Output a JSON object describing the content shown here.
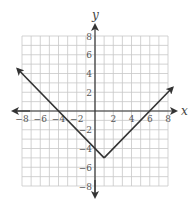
{
  "chart_data": {
    "type": "line",
    "title": "",
    "xlabel": "x",
    "ylabel": "y",
    "xlim": [
      -8,
      8
    ],
    "ylim": [
      -8,
      8
    ],
    "grid": true,
    "grid_step": 1,
    "x_ticks": [
      -8,
      -6,
      -4,
      -2,
      2,
      4,
      6,
      8
    ],
    "y_ticks": [
      8,
      6,
      4,
      2,
      -2,
      -4,
      -6,
      -8
    ],
    "series": [
      {
        "name": "y = |x - 1| - 5",
        "points": [
          [
            -8.5,
            4.5
          ],
          [
            1,
            -5
          ],
          [
            8.5,
            2.5
          ]
        ],
        "vertex": [
          1,
          -5
        ],
        "arrows_both_ends": true,
        "color": "#333333"
      }
    ],
    "legend": null
  },
  "colors": {
    "grid": "#c8c8c8",
    "axis": "#333333",
    "curve": "#333333",
    "text": "#555555"
  }
}
